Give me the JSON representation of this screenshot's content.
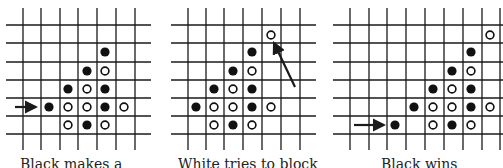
{
  "figure": {
    "line_color": "#1a1a1a",
    "black_stone_color": "#111111",
    "white_stone_fill": "#ffffff",
    "panels": [
      {
        "id": "panel-1",
        "caption": "Black makes a",
        "offset_x": 0,
        "grid": {
          "v_lines": [
            23,
            41,
            60,
            78,
            97,
            116,
            135
          ],
          "v_top": 8,
          "v_bottom": 150,
          "h_lines": [
            25,
            43,
            62,
            80,
            98,
            116,
            134
          ],
          "h_left": 6,
          "h_right": 151
        },
        "stones": [
          {
            "x": 105,
            "y": 52,
            "color": "black"
          },
          {
            "x": 87,
            "y": 71,
            "color": "black"
          },
          {
            "x": 105,
            "y": 71,
            "color": "white"
          },
          {
            "x": 68,
            "y": 89,
            "color": "black"
          },
          {
            "x": 87,
            "y": 89,
            "color": "white"
          },
          {
            "x": 105,
            "y": 89,
            "color": "black"
          },
          {
            "x": 49,
            "y": 107,
            "color": "black"
          },
          {
            "x": 68,
            "y": 107,
            "color": "white"
          },
          {
            "x": 87,
            "y": 107,
            "color": "white"
          },
          {
            "x": 105,
            "y": 107,
            "color": "black"
          },
          {
            "x": 124,
            "y": 107,
            "color": "white"
          },
          {
            "x": 68,
            "y": 125,
            "color": "white"
          },
          {
            "x": 87,
            "y": 125,
            "color": "black"
          },
          {
            "x": 105,
            "y": 125,
            "color": "white"
          }
        ],
        "arrow": {
          "x1": 15,
          "y1": 107,
          "x2": 36,
          "y2": 107
        }
      },
      {
        "id": "panel-2",
        "caption": "White tries to block",
        "offset_x": 165,
        "grid": {
          "v_lines": [
            23,
            41,
            59,
            78,
            97,
            116,
            135
          ],
          "v_top": 8,
          "v_bottom": 150,
          "h_lines": [
            25,
            43,
            62,
            80,
            98,
            116,
            134
          ],
          "h_left": 6,
          "h_right": 151
        },
        "stones": [
          {
            "x": 106,
            "y": 35,
            "color": "white"
          },
          {
            "x": 87,
            "y": 52,
            "color": "black"
          },
          {
            "x": 68,
            "y": 71,
            "color": "black"
          },
          {
            "x": 87,
            "y": 71,
            "color": "white"
          },
          {
            "x": 49,
            "y": 89,
            "color": "black"
          },
          {
            "x": 68,
            "y": 89,
            "color": "white"
          },
          {
            "x": 87,
            "y": 89,
            "color": "black"
          },
          {
            "x": 31,
            "y": 107,
            "color": "black"
          },
          {
            "x": 49,
            "y": 107,
            "color": "white"
          },
          {
            "x": 68,
            "y": 107,
            "color": "white"
          },
          {
            "x": 87,
            "y": 107,
            "color": "black"
          },
          {
            "x": 106,
            "y": 107,
            "color": "white"
          },
          {
            "x": 49,
            "y": 125,
            "color": "white"
          },
          {
            "x": 68,
            "y": 125,
            "color": "black"
          },
          {
            "x": 87,
            "y": 125,
            "color": "white"
          }
        ],
        "arrow": {
          "x1": 130,
          "y1": 87,
          "x2": 109,
          "y2": 43
        }
      },
      {
        "id": "panel-3",
        "caption": "Black wins",
        "offset_x": 333,
        "grid": {
          "v_lines": [
            17,
            36,
            54,
            73,
            92,
            111,
            130,
            149,
            167
          ],
          "v_top": 8,
          "v_bottom": 150,
          "h_lines": [
            25,
            43,
            62,
            80,
            98,
            116,
            134
          ],
          "h_left": 0,
          "h_right": 170
        },
        "stones": [
          {
            "x": 157,
            "y": 35,
            "color": "white"
          },
          {
            "x": 138,
            "y": 52,
            "color": "black"
          },
          {
            "x": 119,
            "y": 71,
            "color": "black"
          },
          {
            "x": 138,
            "y": 71,
            "color": "white"
          },
          {
            "x": 100,
            "y": 89,
            "color": "black"
          },
          {
            "x": 119,
            "y": 89,
            "color": "white"
          },
          {
            "x": 138,
            "y": 89,
            "color": "black"
          },
          {
            "x": 81,
            "y": 107,
            "color": "black"
          },
          {
            "x": 100,
            "y": 107,
            "color": "white"
          },
          {
            "x": 119,
            "y": 107,
            "color": "white"
          },
          {
            "x": 138,
            "y": 107,
            "color": "black"
          },
          {
            "x": 157,
            "y": 107,
            "color": "white"
          },
          {
            "x": 62,
            "y": 125,
            "color": "black"
          },
          {
            "x": 100,
            "y": 125,
            "color": "white"
          },
          {
            "x": 119,
            "y": 125,
            "color": "black"
          },
          {
            "x": 138,
            "y": 125,
            "color": "white"
          }
        ],
        "arrow": {
          "x1": 21,
          "y1": 125,
          "x2": 51,
          "y2": 125
        }
      }
    ]
  }
}
